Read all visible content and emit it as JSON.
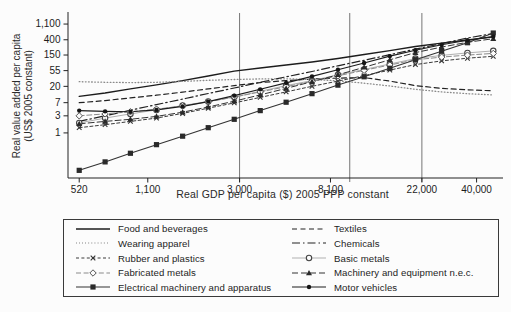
{
  "figure": {
    "background": "#fcfcfc",
    "ink": "#1c1c1c"
  },
  "chart_data": {
    "type": "line",
    "title": "",
    "xlabel": "Real GDP per capita ($) 2005 PPP constant",
    "ylabel": "Real value added per capita (US$ 2005 constant)",
    "ylabel_line1": "Real value added per capita",
    "ylabel_line2": "(US$ 2005 constant)",
    "x_scale": "log",
    "y_scale": "log",
    "xlim": [
      460,
      50000
    ],
    "ylim": [
      0.055,
      2100
    ],
    "x_ticks": [
      520,
      1100,
      3000,
      8100,
      22000,
      40000
    ],
    "x_tick_labels": [
      "520",
      "1,100",
      "3,000",
      "8,100",
      "22,000",
      "40,000"
    ],
    "y_ticks": [
      1,
      3,
      7,
      20,
      55,
      150,
      400,
      1100
    ],
    "y_tick_labels": [
      "1",
      "3",
      "7",
      "20",
      "55",
      "150",
      "400",
      "1,100"
    ],
    "reference_lines_x": [
      3000,
      10000,
      22000
    ],
    "legend_position": "bottom",
    "grid": "off",
    "x": [
      520,
      690,
      910,
      1210,
      1610,
      2130,
      2830,
      3760,
      4990,
      6620,
      8790,
      11700,
      15500,
      20500,
      27300,
      36200,
      48000
    ],
    "series": [
      {
        "name": "Food and beverages",
        "color": "#1c1c1c",
        "width": 1.3,
        "dash": "",
        "marker": "none",
        "marker_color": "#1c1c1c",
        "values": [
          10.5,
          13,
          17,
          22,
          29,
          39,
          53,
          65,
          79,
          96,
          120,
          155,
          200,
          260,
          320,
          395,
          480
        ]
      },
      {
        "name": "Textiles",
        "color": "#222222",
        "width": 1.2,
        "dash": "5,3.5",
        "marker": "none",
        "marker_color": "#222222",
        "values": [
          7,
          8,
          9.5,
          11.3,
          13.8,
          17,
          21,
          25.5,
          29,
          32,
          34,
          35,
          28,
          21,
          17.5,
          16,
          15
        ]
      },
      {
        "name": "Wearing apparel",
        "color": "#8a8a8a",
        "width": 1.3,
        "dash": "0.7,2.4",
        "marker": "none",
        "marker_color": "#8a8a8a",
        "values": [
          27,
          26,
          25.5,
          26,
          27.5,
          29.5,
          31,
          32.3,
          32.5,
          31,
          28.5,
          24.5,
          20.5,
          16.5,
          14,
          12.5,
          11.5
        ]
      },
      {
        "name": "Chemicals",
        "color": "#222222",
        "width": 1.2,
        "dash": "8,3,1.5,3",
        "marker": "none",
        "marker_color": "#222222",
        "values": [
          2.1,
          3,
          4.3,
          6.2,
          8.8,
          12.6,
          18,
          26,
          37,
          52,
          75,
          107,
          153,
          219,
          313,
          448,
          600
        ]
      },
      {
        "name": "Rubber and plastics",
        "color": "#3a3a3a",
        "width": 1,
        "dash": "3,2.4",
        "marker": "x",
        "marker_color": "#333333",
        "values": [
          1.4,
          1.7,
          2.1,
          2.6,
          3.5,
          4.9,
          6.9,
          9.8,
          14,
          20,
          28,
          40,
          57,
          81,
          103,
          122,
          138
        ]
      },
      {
        "name": "Basic metals",
        "color": "#b0b0b0",
        "width": 1,
        "dash": "",
        "marker": "circle-open",
        "marker_color": "#444444",
        "values": [
          1.9,
          2.6,
          3.4,
          4.4,
          5.8,
          7.6,
          10,
          14.5,
          21,
          29,
          42,
          59,
          84,
          119,
          146,
          172,
          196
        ]
      },
      {
        "name": "Fabricated metals",
        "color": "#8a8a8a",
        "width": 1,
        "dash": "5,2.6",
        "marker": "diamond-open",
        "marker_color": "#555555",
        "values": [
          3,
          3.4,
          3.9,
          4.6,
          5.7,
          7.4,
          10,
          14,
          19.6,
          27.5,
          39.5,
          56,
          79,
          110,
          131,
          149,
          166
        ]
      },
      {
        "name": "Machinery and equipment n.e.c.",
        "color": "#333333",
        "width": 1,
        "dash": "6,3",
        "marker": "triangle",
        "marker_color": "#2a2a2a",
        "values": [
          1.8,
          2.1,
          2.4,
          2.9,
          3.8,
          5.3,
          7.7,
          11.5,
          17.5,
          27,
          42,
          68,
          110,
          175,
          250,
          340,
          430
        ]
      },
      {
        "name": "Electrical machinery and apparatus",
        "color": "#333333",
        "width": 1.1,
        "dash": "",
        "marker": "square",
        "marker_color": "#2a2a2a",
        "values": [
          0.09,
          0.155,
          0.27,
          0.47,
          0.81,
          1.4,
          2.4,
          4.2,
          7.2,
          12.5,
          21.6,
          37,
          64,
          111,
          192,
          331,
          617
        ]
      },
      {
        "name": "Motor vehicles",
        "color": "#1c1c1c",
        "width": 1.1,
        "dash": "",
        "marker": "dot",
        "marker_color": "#151515",
        "values": [
          4.2,
          4,
          3.9,
          4.4,
          5.5,
          7.5,
          11,
          16.5,
          25,
          38,
          58,
          90,
          140,
          205,
          290,
          390,
          490
        ]
      }
    ]
  }
}
